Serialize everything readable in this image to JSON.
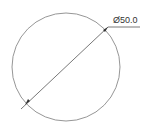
{
  "drawing": {
    "dimension_label": "Ø50.0",
    "dimension_type": "diameter",
    "colors": {
      "circle": "#7a7a7a",
      "leader": "#555555",
      "text": "#333333",
      "background": "#ffffff"
    }
  }
}
